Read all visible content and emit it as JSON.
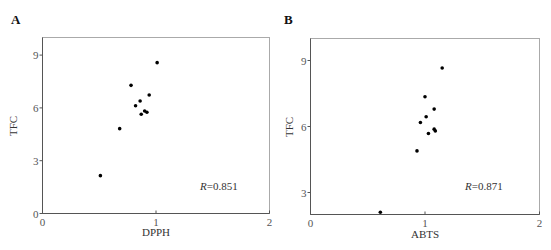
{
  "figure": {
    "panels": [
      {
        "id": "A",
        "label": "A",
        "xlabel": "DPPH",
        "ylabel": "TFC",
        "annotation": {
          "symbol": "R",
          "text": "=0.851"
        }
      },
      {
        "id": "B",
        "label": "B",
        "xlabel": "ABTS",
        "ylabel": "TFC",
        "annotation": {
          "symbol": "R",
          "text": "=0.871"
        }
      }
    ]
  },
  "chart_data": [
    {
      "type": "scatter",
      "title": "A",
      "xlabel": "DPPH",
      "ylabel": "TFC",
      "xlim": [
        0,
        2
      ],
      "ylim": [
        0,
        10
      ],
      "xticks": [
        0,
        1,
        2
      ],
      "yticks": [
        0,
        3,
        6,
        9
      ],
      "grid": false,
      "legend": null,
      "annotations": [
        "R=0.851"
      ],
      "points": [
        {
          "x": 1.01,
          "y": 8.57
        },
        {
          "x": 0.78,
          "y": 7.28
        },
        {
          "x": 0.94,
          "y": 6.73
        },
        {
          "x": 0.86,
          "y": 6.39
        },
        {
          "x": 0.82,
          "y": 6.12
        },
        {
          "x": 0.9,
          "y": 5.82
        },
        {
          "x": 0.92,
          "y": 5.75
        },
        {
          "x": 0.87,
          "y": 5.64
        },
        {
          "x": 0.68,
          "y": 4.82
        },
        {
          "x": 0.51,
          "y": 2.15
        }
      ],
      "r": 0.851
    },
    {
      "type": "scatter",
      "title": "B",
      "xlabel": "ABTS",
      "ylabel": "TFC",
      "xlim": [
        0,
        2
      ],
      "ylim": [
        2,
        10
      ],
      "xticks": [
        0,
        1,
        2
      ],
      "yticks": [
        3,
        6,
        9
      ],
      "grid": false,
      "legend": null,
      "annotations": [
        "R=0.871"
      ],
      "points": [
        {
          "x": 1.15,
          "y": 8.66
        },
        {
          "x": 1.0,
          "y": 7.35
        },
        {
          "x": 1.08,
          "y": 6.79
        },
        {
          "x": 1.01,
          "y": 6.44
        },
        {
          "x": 0.96,
          "y": 6.18
        },
        {
          "x": 1.08,
          "y": 5.88
        },
        {
          "x": 1.09,
          "y": 5.8
        },
        {
          "x": 1.03,
          "y": 5.68
        },
        {
          "x": 0.93,
          "y": 4.89
        },
        {
          "x": 0.61,
          "y": 2.1
        }
      ],
      "r": 0.871
    }
  ]
}
